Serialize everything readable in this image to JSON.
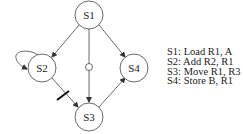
{
  "diagram": {
    "nodes": [
      {
        "id": "S1",
        "label": "S1",
        "cx": 89,
        "cy": 15
      },
      {
        "id": "S2",
        "label": "S2",
        "cx": 42,
        "cy": 68
      },
      {
        "id": "S3",
        "label": "S3",
        "cx": 89,
        "cy": 117
      },
      {
        "id": "S4",
        "label": "S4",
        "cx": 134,
        "cy": 68
      }
    ],
    "edges": [
      {
        "from": "S1",
        "to": "S2",
        "type": "arrow"
      },
      {
        "from": "S1",
        "to": "S3",
        "type": "arrow",
        "marker": "small-circle"
      },
      {
        "from": "S1",
        "to": "S4",
        "type": "arrow"
      },
      {
        "from": "S2",
        "to": "S2",
        "type": "self-loop"
      },
      {
        "from": "S2",
        "to": "S3",
        "type": "arrow",
        "marker": "bar"
      },
      {
        "from": "S3",
        "to": "S4",
        "type": "arrow"
      }
    ],
    "colors": {
      "stroke": "#444444",
      "text": "#222222",
      "background": "#ffffff"
    }
  },
  "legend": {
    "items": [
      "S1: Load R1, A",
      "S2: Add R2, R1",
      "S3: Move R1, R3",
      "S4: Store B, R1"
    ]
  }
}
